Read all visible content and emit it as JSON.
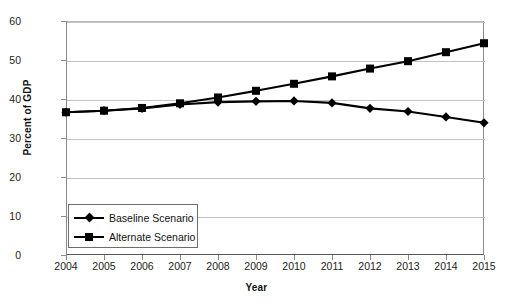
{
  "chart_data": {
    "type": "line",
    "title": "",
    "xlabel": "Year",
    "ylabel": "Percent of GDP",
    "categories": [
      "2004",
      "2005",
      "2006",
      "2007",
      "2008",
      "2009",
      "2010",
      "2011",
      "2012",
      "2013",
      "2014",
      "2015"
    ],
    "x": [
      2004,
      2005,
      2006,
      2007,
      2008,
      2009,
      2010,
      2011,
      2012,
      2013,
      2014,
      2015
    ],
    "xlim": [
      2004,
      2015
    ],
    "ylim": [
      0,
      60
    ],
    "yticks": [
      0,
      10,
      20,
      30,
      40,
      50,
      60
    ],
    "ytick_labels": [
      "0",
      "10",
      "20",
      "30",
      "40",
      "50",
      "60"
    ],
    "grid": true,
    "legend_position": "lower-left-inside",
    "series": [
      {
        "name": "Baseline Scenario",
        "marker": "diamond",
        "color": "#000000",
        "values": [
          36.6,
          37.0,
          37.6,
          38.6,
          39.2,
          39.4,
          39.5,
          39.0,
          37.6,
          36.8,
          35.4,
          33.9
        ]
      },
      {
        "name": "Alternate Scenario",
        "marker": "square",
        "color": "#000000",
        "values": [
          36.6,
          37.0,
          37.7,
          38.9,
          40.4,
          42.1,
          43.9,
          45.8,
          47.8,
          49.7,
          52.0,
          54.3
        ]
      }
    ]
  },
  "legend": {
    "items": [
      {
        "label": "Baseline Scenario"
      },
      {
        "label": "Alternate Scenario"
      }
    ]
  }
}
